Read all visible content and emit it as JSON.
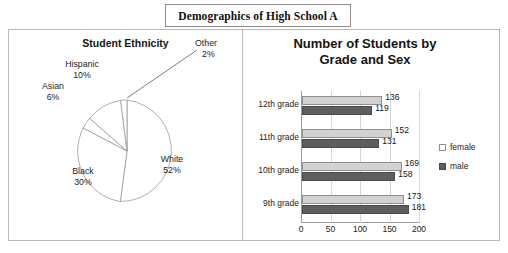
{
  "page": {
    "top_cut_text": "",
    "title": "Demographics of High School A"
  },
  "pie_panel": {
    "title": "Student Ethnicity",
    "labels": [
      {
        "name": "White",
        "pct": "52%"
      },
      {
        "name": "Black",
        "pct": "30%"
      },
      {
        "name": "Asian",
        "pct": "6%"
      },
      {
        "name": "Hispanic",
        "pct": "10%"
      },
      {
        "name": "Other",
        "pct": "2%"
      }
    ]
  },
  "bar_panel": {
    "title_line1": "Number of Students by",
    "title_line2": "Grade and Sex",
    "legend": [
      {
        "label": "female",
        "color": "#ffffff"
      },
      {
        "label": "male",
        "color": "#5e5e5e"
      }
    ]
  },
  "chart_data": [
    {
      "type": "pie",
      "title": "Student Ethnicity",
      "categories": [
        "White",
        "Black",
        "Hispanic",
        "Asian",
        "Other"
      ],
      "values": [
        52,
        30,
        10,
        6,
        2
      ],
      "unit": "percent",
      "labels": [
        "White 52%",
        "Black 30%",
        "Hispanic 10%",
        "Asian 6%",
        "Other 2%"
      ],
      "legend": "none",
      "slice_fill": "#ffffff",
      "slice_outline": "#9a9a9a"
    },
    {
      "type": "bar",
      "orientation": "horizontal",
      "title": "Number of Students by Grade and Sex",
      "categories": [
        "12th grade",
        "11th grade",
        "10th grade",
        "9th grade"
      ],
      "series": [
        {
          "name": "female",
          "values": [
            136,
            152,
            169,
            173
          ],
          "color": "#d2d2d2"
        },
        {
          "name": "male",
          "values": [
            119,
            131,
            158,
            181
          ],
          "color": "#5e5e5e"
        }
      ],
      "xlabel": "",
      "ylabel": "",
      "xlim": [
        0,
        200
      ],
      "xticks": [
        0,
        50,
        100,
        150,
        200
      ],
      "grid": "vertical",
      "legend_position": "right",
      "data_labels": true
    }
  ]
}
